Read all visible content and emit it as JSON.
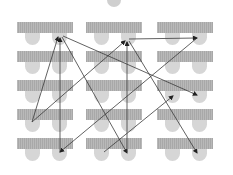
{
  "diagram": {
    "type": "classroom-seating-chart",
    "teacher": {
      "x": 114,
      "y": 0,
      "r": 7
    },
    "columns_x": [
      17,
      86,
      157
    ],
    "rows_y": [
      22,
      51,
      80,
      109,
      138
    ],
    "desk": {
      "width": 56,
      "height": 11
    },
    "chair_offsets_x": [
      8,
      35
    ],
    "chair": {
      "width": 15,
      "height": 12
    },
    "colors": {
      "desk": "#b3b3b3",
      "chair": "#d6d6d6",
      "teacher": "#cfcfcf",
      "arrow": "#3a3a3a"
    },
    "arrows": [
      {
        "from": [
          32,
          122
        ],
        "to": [
          58,
          37
        ]
      },
      {
        "from": [
          60,
          152
        ],
        "to": [
          60,
          38
        ]
      },
      {
        "from": [
          62,
          37
        ],
        "to": [
          127,
          153
        ]
      },
      {
        "from": [
          63,
          36
        ],
        "to": [
          197,
          95
        ]
      },
      {
        "from": [
          32,
          122
        ],
        "to": [
          125,
          41
        ]
      },
      {
        "from": [
          197,
          38
        ],
        "to": [
          60,
          152
        ]
      },
      {
        "from": [
          129,
          39
        ],
        "to": [
          197,
          38
        ]
      },
      {
        "from": [
          127,
          152
        ],
        "to": [
          127,
          42
        ]
      },
      {
        "from": [
          129,
          41
        ],
        "to": [
          197,
          153
        ]
      },
      {
        "from": [
          104,
          152
        ],
        "to": [
          173,
          96
        ]
      }
    ]
  }
}
